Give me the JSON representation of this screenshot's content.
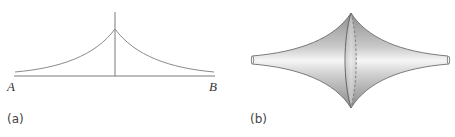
{
  "figure": {
    "panel_a": {
      "label": "(a)",
      "point_left": "A",
      "point_right": "B",
      "description": "Catenary-like cusp curve above segment AB with vertical axis at center"
    },
    "panel_b": {
      "label": "(b)",
      "description": "Surface of revolution with cusped rim (pseudosphere-like), meridian circle shown with solid front and dashed back"
    },
    "colors": {
      "line": "#7a7a7a",
      "shade_dark": "#9a9a9a",
      "shade_light": "#f4f4f4"
    }
  }
}
